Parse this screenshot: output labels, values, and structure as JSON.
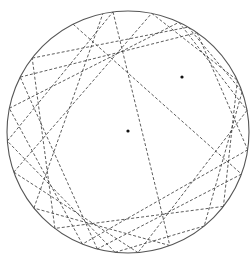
{
  "figure": {
    "width": 252,
    "height": 255,
    "background": "#ffffff"
  },
  "circle": {
    "cx": 128,
    "cy": 132,
    "r": 121,
    "stroke": "#555555",
    "stroke_width": 1.1
  },
  "foci": [
    {
      "x": 182,
      "y": 77
    },
    {
      "x": 128,
      "y": 131
    }
  ],
  "trajectory": {
    "stroke": "#333333",
    "stroke_width": 0.8,
    "dash": "3,2",
    "boundary_points": [
      [
        73,
        24
      ],
      [
        244,
        175
      ],
      [
        97,
        250
      ],
      [
        20,
        77
      ],
      [
        199,
        30
      ],
      [
        249,
        150
      ],
      [
        82,
        245
      ],
      [
        8,
        108
      ],
      [
        181,
        18
      ],
      [
        249,
        110
      ],
      [
        138,
        253
      ],
      [
        14,
        172
      ],
      [
        152,
        12
      ],
      [
        238,
        80
      ],
      [
        228,
        210
      ],
      [
        56,
        227
      ],
      [
        32,
        58
      ],
      [
        190,
        24
      ],
      [
        216,
        101
      ],
      [
        205,
        227
      ],
      [
        115,
        252
      ],
      [
        7,
        141
      ],
      [
        113,
        12
      ],
      [
        170,
        246
      ],
      [
        34,
        208
      ],
      [
        103,
        14
      ]
    ]
  }
}
